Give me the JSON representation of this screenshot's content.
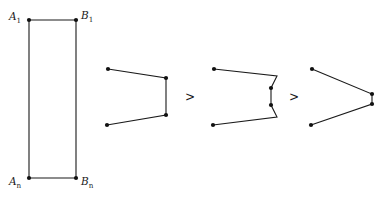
{
  "figure": {
    "kind": "mathematical-diagram",
    "background_color": "#ffffff",
    "stroke_color": "#1a1a1a",
    "vertex_color": "#111111",
    "canvas": {
      "width": 387,
      "height": 198
    }
  },
  "rectangle": {
    "name": "labelled-rectangle",
    "corners": [
      {
        "id": "A1",
        "x": 29,
        "y": 20
      },
      {
        "id": "B1",
        "x": 76,
        "y": 20
      },
      {
        "id": "Bn",
        "x": 76,
        "y": 178
      },
      {
        "id": "An",
        "x": 29,
        "y": 178
      }
    ],
    "labels": [
      {
        "id": "A1",
        "base": "A",
        "subscript": "1",
        "x": 9,
        "y": 20,
        "anchor": "start"
      },
      {
        "id": "B1",
        "base": "B",
        "subscript": "1",
        "x": 81,
        "y": 19,
        "anchor": "start"
      },
      {
        "id": "An",
        "base": "A",
        "subscript": "n",
        "x": 9,
        "y": 185,
        "anchor": "start"
      },
      {
        "id": "Bn",
        "base": "B",
        "subscript": "n",
        "x": 81,
        "y": 185,
        "anchor": "start"
      }
    ]
  },
  "shapes": [
    {
      "id": "shape-1",
      "name": "polyline-shape-wide-notch",
      "points": [
        {
          "x": 108,
          "y": 69
        },
        {
          "x": 166,
          "y": 78
        },
        {
          "x": 166,
          "y": 115
        },
        {
          "x": 107,
          "y": 125
        }
      ],
      "dots": [
        {
          "x": 108,
          "y": 69
        },
        {
          "x": 166,
          "y": 78
        },
        {
          "x": 166,
          "y": 115
        },
        {
          "x": 107,
          "y": 125
        }
      ]
    },
    {
      "id": "shape-2",
      "name": "polyline-shape-stepped-notch",
      "points": [
        {
          "x": 214,
          "y": 69
        },
        {
          "x": 277,
          "y": 76
        },
        {
          "x": 271,
          "y": 88
        },
        {
          "x": 271,
          "y": 105
        },
        {
          "x": 277,
          "y": 117
        },
        {
          "x": 213,
          "y": 125
        }
      ],
      "dots": [
        {
          "x": 214,
          "y": 69
        },
        {
          "x": 271,
          "y": 88
        },
        {
          "x": 271,
          "y": 105
        },
        {
          "x": 213,
          "y": 125
        }
      ]
    },
    {
      "id": "shape-3",
      "name": "polyline-shape-narrow-notch",
      "points": [
        {
          "x": 312,
          "y": 69
        },
        {
          "x": 372,
          "y": 94
        },
        {
          "x": 372,
          "y": 104
        },
        {
          "x": 311,
          "y": 125
        }
      ],
      "dots": [
        {
          "x": 312,
          "y": 69
        },
        {
          "x": 372,
          "y": 94
        },
        {
          "x": 372,
          "y": 104
        },
        {
          "x": 311,
          "y": 125
        }
      ]
    }
  ],
  "relations": [
    {
      "id": "rel-1",
      "symbol": ">",
      "x": 190,
      "y": 101
    },
    {
      "id": "rel-2",
      "symbol": ">",
      "x": 294,
      "y": 101
    }
  ]
}
